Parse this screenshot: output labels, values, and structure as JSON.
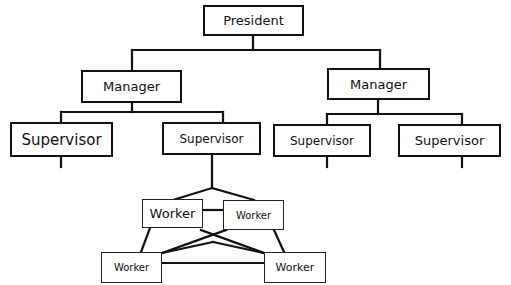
{
  "diagram": {
    "type": "organization-chart",
    "line_color": "#111111",
    "nodes": {
      "president": {
        "label": "President"
      },
      "manager_left": {
        "label": "Manager"
      },
      "manager_right": {
        "label": "Manager"
      },
      "supervisor_1": {
        "label": "Supervisor"
      },
      "supervisor_2": {
        "label": "Supervisor"
      },
      "supervisor_3": {
        "label": "Supervisor"
      },
      "supervisor_4": {
        "label": "Supervisor"
      },
      "worker_top_left": {
        "label": "Worker"
      },
      "worker_top_right": {
        "label": "Worker"
      },
      "worker_bottom_left": {
        "label": "Worker"
      },
      "worker_bottom_right": {
        "label": "Worker"
      }
    },
    "edges": [
      [
        "president",
        "manager_left"
      ],
      [
        "president",
        "manager_right"
      ],
      [
        "manager_left",
        "supervisor_1"
      ],
      [
        "manager_left",
        "supervisor_2"
      ],
      [
        "manager_right",
        "supervisor_3"
      ],
      [
        "manager_right",
        "supervisor_4"
      ],
      [
        "supervisor_2",
        "worker_top_left"
      ],
      [
        "supervisor_2",
        "worker_top_right"
      ],
      [
        "worker_top_left",
        "worker_top_right"
      ],
      [
        "worker_top_left",
        "worker_bottom_left"
      ],
      [
        "worker_top_right",
        "worker_bottom_right"
      ],
      [
        "worker_bottom_left",
        "worker_bottom_right"
      ],
      [
        "worker_top_left",
        "worker_bottom_right"
      ],
      [
        "worker_top_right",
        "worker_bottom_left"
      ]
    ]
  }
}
